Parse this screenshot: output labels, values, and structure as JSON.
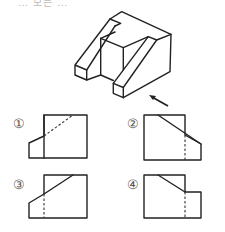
{
  "question": {
    "heading_partial": "… 모든 …",
    "instruction": "화살표 방향에서 본 투상도로 옳은 것은?"
  },
  "figure": {
    "type": "isometric-object",
    "view_direction_arrow": "arrow pointing up-left toward front-right face"
  },
  "options": [
    {
      "number": "1",
      "label": "①",
      "description": "Step on left, solid step edge, dashed slope line on right block"
    },
    {
      "number": "2",
      "label": "②",
      "description": "Step on right, solid slope line, dashed vertical line"
    },
    {
      "number": "3",
      "label": "③",
      "description": "Step on left, solid slope line, dashed vertical line"
    },
    {
      "number": "4",
      "label": "④",
      "description": "Slope then flat step on right, dashed vertical line"
    }
  ],
  "colors": {
    "line": "#222222",
    "label": "#555555",
    "background": "#ffffff"
  }
}
